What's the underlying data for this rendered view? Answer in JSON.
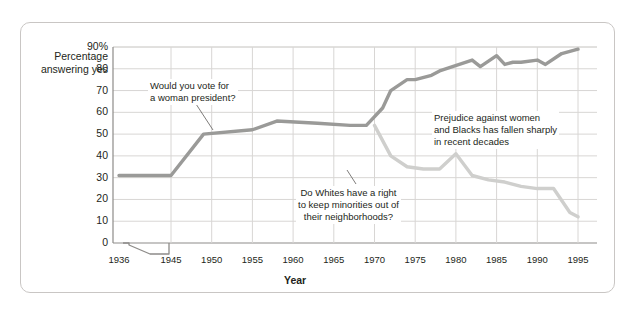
{
  "chart_data": {
    "type": "line",
    "title": "",
    "xlabel": "Year",
    "ylabel": "Percentage answering yes",
    "ylim": [
      0,
      90
    ],
    "xlim": [
      1936,
      1997
    ],
    "grid": true,
    "legend_position": "none",
    "axis_break": "between 1936 and 1945",
    "y_ticks": [
      "0",
      "10",
      "20",
      "30",
      "40",
      "50",
      "60",
      "70",
      "80",
      "90%"
    ],
    "y_tick_values": [
      0,
      10,
      20,
      30,
      40,
      50,
      60,
      70,
      80,
      90
    ],
    "x_ticks": [
      "1936",
      "1945",
      "1950",
      "1955",
      "1960",
      "1965",
      "1970",
      "1975",
      "1980",
      "1985",
      "1990",
      "1995"
    ],
    "x_tick_values": [
      1936,
      1945,
      1950,
      1955,
      1960,
      1965,
      1970,
      1975,
      1980,
      1985,
      1990,
      1995
    ],
    "series": [
      {
        "name": "Would you vote for a woman president?",
        "color": "#9a9a98",
        "x": [
          1936,
          1945,
          1949,
          1955,
          1958,
          1963,
          1967,
          1969,
          1971,
          1972,
          1974,
          1975,
          1977,
          1978,
          1982,
          1983,
          1985,
          1986,
          1987,
          1988,
          1990,
          1991,
          1993,
          1995
        ],
        "values": [
          31,
          31,
          50,
          52,
          56,
          55,
          54,
          54,
          62,
          70,
          75,
          75,
          77,
          79,
          84,
          81,
          86,
          82,
          83,
          83,
          84,
          82,
          87,
          89
        ]
      },
      {
        "name": "Do Whites have a right to keep minorities out of their neighborhoods?",
        "color": "#cfcfcd",
        "x": [
          1970,
          1972,
          1974,
          1976,
          1978,
          1980,
          1982,
          1984,
          1986,
          1988,
          1990,
          1992,
          1994,
          1995
        ],
        "values": [
          54,
          40,
          35,
          34,
          34,
          41,
          31,
          29,
          28,
          26,
          25,
          25,
          14,
          12
        ]
      }
    ],
    "annotations": [
      {
        "id": "anno-woman",
        "text": "Would you vote for\na woman president?",
        "target_series": "Would you vote for a woman president?"
      },
      {
        "id": "anno-whites",
        "text": "Do Whites have a right\nto keep minorities out of\ntheir neighborhoods?",
        "target_series": "Do Whites have a right to keep minorities out of their neighborhoods?"
      },
      {
        "id": "anno-prejudice",
        "text": "Prejudice against women\nand Blacks has fallen sharply\nin recent decades",
        "target_series": ""
      }
    ]
  },
  "colors": {
    "panel_border": "#c9c6c4",
    "grid": "#d8d6d4",
    "axis": "#8d8b89",
    "text": "#231f20",
    "series_dark": "#9a9a98",
    "series_light": "#cfcfcd"
  }
}
